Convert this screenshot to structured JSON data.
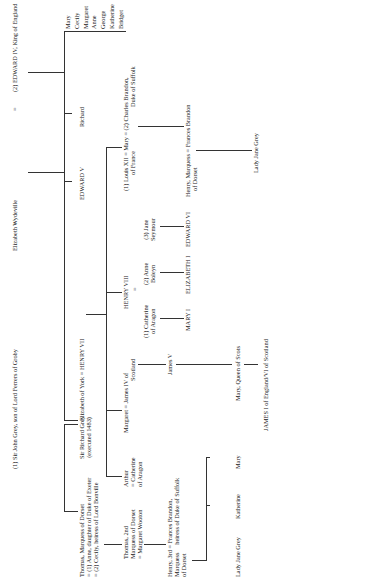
{
  "diagram": {
    "type": "family-tree",
    "orientation": "rotated-90-ccw",
    "gen1": {
      "grey": "(1) Sir John Grey, son of Lord Ferrers of Groby",
      "eq1": "=",
      "woodville": "Elizabeth Wydeville",
      "eq2": "=",
      "edward4": "(2) EDWARD IV, King of England"
    },
    "gen2": {
      "thomas": [
        "Thomas, Marquess of Dorset",
        "= (1) Anne, daughter of Duke of Exeter",
        "= (2) Cecily, heiress of Lord Bonville"
      ],
      "richard_grey": [
        "Sir Richard Grey",
        "(executed 1483)"
      ],
      "eliz_york": "Elizabeth of York = HENRY VII",
      "edward5": "EDWARD V",
      "richard": "Richard",
      "sisters": [
        "Mary",
        "Cecily",
        "Margaret",
        "Anne",
        "George",
        "Katherine",
        "Bridget"
      ]
    },
    "gen3": {
      "thomas2": [
        "Thomas, 2nd",
        "Marquess of Dorset",
        "= Margaret Wooton"
      ],
      "arthur": [
        "Arthur",
        "= Catherine",
        "of Aragon"
      ],
      "margaret": [
        "Margaret = James IV of",
        "Scotland"
      ],
      "henry8": "HENRY VIII",
      "henry8_eq": "=",
      "wives": [
        [
          "(1) Catherine",
          "of Aragon"
        ],
        [
          "(2) Anne",
          "Boleyn"
        ],
        [
          "(3) Jane",
          "Seymour"
        ]
      ],
      "mary_tudor": [
        "(1) Louis XII = Mary = (2) Charles Brandon,",
        "of France",
        "Duke of Suffolk"
      ]
    },
    "gen4": {
      "henry3": [
        "Henry, 3rd = Frances Brandon,",
        "Marquess     heiress of Duke of Suffolk",
        "of Dorset"
      ],
      "james5": "James V",
      "mary1": "MARY I",
      "elizabeth1": "ELIZABETH I",
      "edward6": "EDWARD VI",
      "henry_frances": [
        "Henry, Marquess = Frances Brandon",
        "of Dorset"
      ]
    },
    "gen5": {
      "children": [
        "Lady Jane Grey",
        "Katherine",
        "Mary"
      ],
      "mary_scots": "Mary, Queen of Scots",
      "lady_jane_right": "Lady Jane Grey"
    },
    "gen6": {
      "james1": "JAMES I of England/VI of Scotland"
    }
  }
}
